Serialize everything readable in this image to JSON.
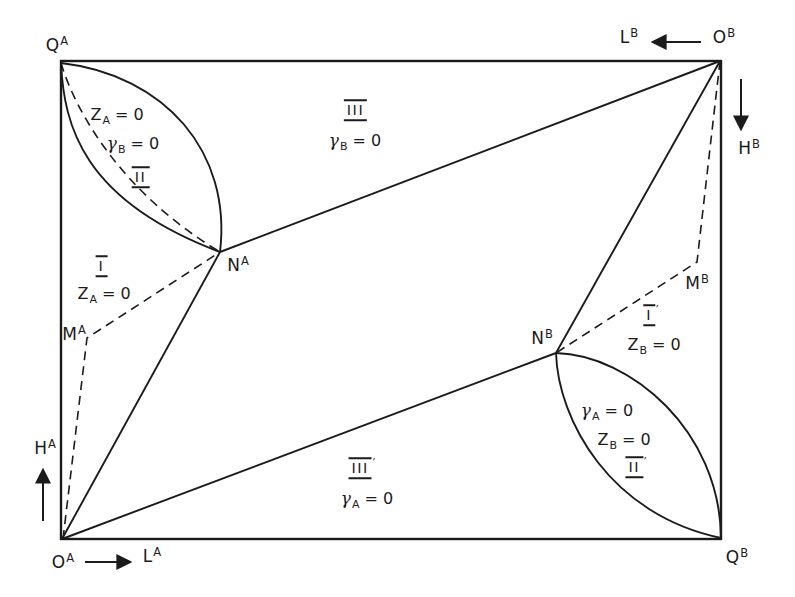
{
  "colors": {
    "ink": "#1b1b1b",
    "background": "#ffffff"
  },
  "points": {
    "QA": {
      "base": "Q",
      "sup": "A"
    },
    "OB": {
      "base": "O",
      "sup": "B"
    },
    "OA": {
      "base": "O",
      "sup": "A"
    },
    "QB": {
      "base": "Q",
      "sup": "B"
    },
    "NA": {
      "base": "N",
      "sup": "A"
    },
    "NB": {
      "base": "N",
      "sup": "B"
    },
    "MA": {
      "base": "M",
      "sup": "A"
    },
    "MB": {
      "base": "M",
      "sup": "B"
    }
  },
  "axes": {
    "LA": {
      "base": "L",
      "sup": "A"
    },
    "LB": {
      "base": "L",
      "sup": "B"
    },
    "HA": {
      "base": "H",
      "sup": "A"
    },
    "HB": {
      "base": "H",
      "sup": "B"
    }
  },
  "regions": {
    "I": {
      "numeral": "I",
      "prime": "",
      "eq1_sym": "Z",
      "eq1_sub": "A",
      "eq1_rest": "= 0"
    },
    "II": {
      "numeral": "II",
      "prime": "",
      "eq1_sym": "Z",
      "eq1_sub": "A",
      "eq1_rest": "= 0",
      "eq2_sym": "γ",
      "eq2_sub": "B",
      "eq2_rest": "= 0"
    },
    "III": {
      "numeral": "III",
      "prime": "",
      "eq1_sym": "γ",
      "eq1_sub": "B",
      "eq1_rest": "= 0"
    },
    "Ip": {
      "numeral": "I",
      "prime": "′",
      "eq1_sym": "Z",
      "eq1_sub": "B",
      "eq1_rest": "= 0"
    },
    "IIp": {
      "numeral": "II",
      "prime": "′",
      "eq1_sym": "γ",
      "eq1_sub": "A",
      "eq1_rest": "= 0",
      "eq2_sym": "Z",
      "eq2_sub": "B",
      "eq2_rest": "= 0"
    },
    "IIIp": {
      "numeral": "III",
      "prime": "′",
      "eq1_sym": "γ",
      "eq1_sub": "A",
      "eq1_rest": "= 0"
    }
  }
}
